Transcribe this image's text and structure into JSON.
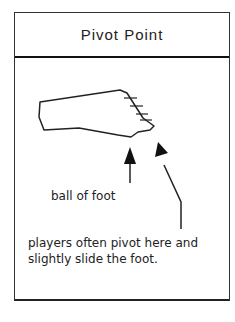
{
  "card": {
    "title": "Pivot Point"
  },
  "figure": {
    "icon": "foot-diagram",
    "labels": {
      "ball_of_foot": "ball of foot",
      "pivot_note": "players often pivot here and slightly slide the foot."
    }
  }
}
